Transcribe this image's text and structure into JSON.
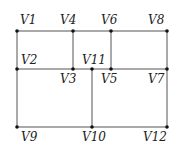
{
  "diagram": {
    "type": "graph",
    "colors": {
      "edge": "#555555",
      "node": "#111111",
      "label": "#222222"
    },
    "nodes": [
      {
        "id": "V1",
        "label": "V1",
        "x": 17,
        "y": 31,
        "lx": 20,
        "ly": 24
      },
      {
        "id": "V4",
        "label": "V4",
        "x": 73,
        "y": 31,
        "lx": 60,
        "ly": 24
      },
      {
        "id": "V6",
        "label": "V6",
        "x": 111,
        "y": 31,
        "lx": 101,
        "ly": 24
      },
      {
        "id": "V8",
        "label": "V8",
        "x": 167,
        "y": 31,
        "lx": 148,
        "ly": 24
      },
      {
        "id": "V2",
        "label": "V2",
        "x": 17,
        "y": 69,
        "lx": 21,
        "ly": 64
      },
      {
        "id": "V3",
        "label": "V3",
        "x": 73,
        "y": 69,
        "lx": 60,
        "ly": 83
      },
      {
        "id": "V11",
        "label": "V11",
        "x": 92,
        "y": 69,
        "lx": 82,
        "ly": 64
      },
      {
        "id": "V5",
        "label": "V5",
        "x": 111,
        "y": 69,
        "lx": 101,
        "ly": 83
      },
      {
        "id": "V7",
        "label": "V7",
        "x": 167,
        "y": 69,
        "lx": 148,
        "ly": 83
      },
      {
        "id": "V9",
        "label": "V9",
        "x": 17,
        "y": 127,
        "lx": 21,
        "ly": 141
      },
      {
        "id": "V10",
        "label": "V10",
        "x": 92,
        "y": 127,
        "lx": 82,
        "ly": 141
      },
      {
        "id": "V12",
        "label": "V12",
        "x": 167,
        "y": 127,
        "lx": 143,
        "ly": 141
      }
    ],
    "edges": [
      [
        "V1",
        "V4"
      ],
      [
        "V4",
        "V6"
      ],
      [
        "V6",
        "V8"
      ],
      [
        "V1",
        "V2"
      ],
      [
        "V4",
        "V3"
      ],
      [
        "V6",
        "V5"
      ],
      [
        "V8",
        "V7"
      ],
      [
        "V2",
        "V3"
      ],
      [
        "V3",
        "V11"
      ],
      [
        "V11",
        "V5"
      ],
      [
        "V5",
        "V7"
      ],
      [
        "V2",
        "V9"
      ],
      [
        "V11",
        "V10"
      ],
      [
        "V7",
        "V12"
      ],
      [
        "V9",
        "V10"
      ],
      [
        "V10",
        "V12"
      ]
    ]
  }
}
